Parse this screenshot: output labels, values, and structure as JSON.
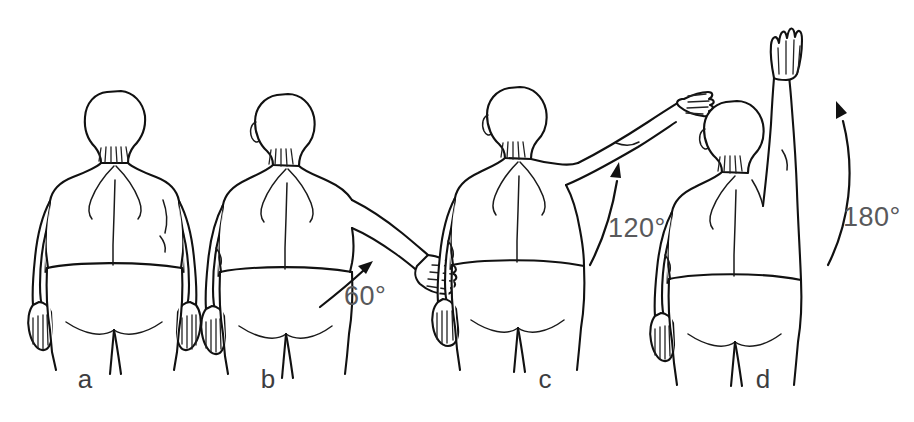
{
  "figure": {
    "background_color": "#ffffff",
    "line_color": "#111111",
    "label_color": "#3d3d3f",
    "angle_text_color": "#59595b",
    "view": "posterior (from behind)",
    "width": 914,
    "height": 422
  },
  "panels": [
    {
      "id": "a",
      "label": "a",
      "label_x": 85,
      "label_y": 388,
      "angle_value": 0,
      "angle_label": "",
      "angle_label_x": 0,
      "angle_label_y": 0,
      "has_arrow": false,
      "description": "Arms resting at sides, neutral position"
    },
    {
      "id": "b",
      "label": "b",
      "label_x": 268,
      "label_y": 388,
      "angle_value": 60,
      "angle_label": "60°",
      "angle_label_x": 344,
      "angle_label_y": 305,
      "has_arrow": true,
      "description": "Left arm abducted to 60 degrees"
    },
    {
      "id": "c",
      "label": "c",
      "label_x": 545,
      "label_y": 388,
      "angle_value": 120,
      "angle_label": "120°",
      "angle_label_x": 608,
      "angle_label_y": 237,
      "has_arrow": true,
      "description": "Left arm abducted to 120 degrees"
    },
    {
      "id": "d",
      "label": "d",
      "label_x": 763,
      "label_y": 388,
      "angle_value": 180,
      "angle_label": "180°",
      "angle_label_x": 843,
      "angle_label_y": 226,
      "has_arrow": true,
      "description": "Left arm fully abducted overhead to 180 degrees"
    }
  ]
}
